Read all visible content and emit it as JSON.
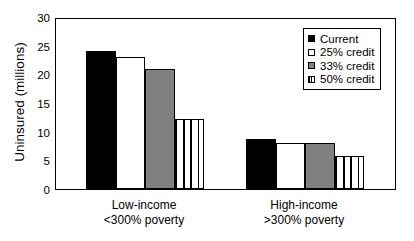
{
  "chart_data": {
    "type": "bar",
    "title": "",
    "subtitle": "",
    "xlabel": "",
    "ylabel": "Uninsured (millions)",
    "ylim": [
      0,
      30
    ],
    "yticks": [
      0,
      5,
      10,
      15,
      20,
      25,
      30
    ],
    "ytick_labels": [
      "0",
      "5",
      "10",
      "15",
      "20",
      "25",
      "30"
    ],
    "grid": false,
    "legend_position": "top-right",
    "categories": [
      "Low-income <300% poverty",
      "High-income >300% poverty"
    ],
    "category_lines": [
      {
        "line1": "Low-income",
        "line2": "<300% poverty"
      },
      {
        "line1": "High-income",
        "line2": ">300% poverty"
      }
    ],
    "series": [
      {
        "name": "Current",
        "values": [
          24.0,
          8.7
        ],
        "fill": "solid-black",
        "color": "#000000"
      },
      {
        "name": "25% credit",
        "values": [
          23.0,
          8.1
        ],
        "fill": "white",
        "color": "#ffffff"
      },
      {
        "name": "33% credit",
        "values": [
          21.0,
          8.0
        ],
        "fill": "gray",
        "color": "#808080"
      },
      {
        "name": "50% credit",
        "values": [
          12.2,
          5.8
        ],
        "fill": "vstripe",
        "color": "#ffffff"
      }
    ]
  },
  "legend": {
    "items": [
      {
        "label": "Current",
        "fill": "solid-black"
      },
      {
        "label": "25% credit",
        "fill": "white"
      },
      {
        "label": "33% credit",
        "fill": "gray"
      },
      {
        "label": "50% credit",
        "fill": "vstripe"
      }
    ]
  },
  "colors": {
    "axis": "#000000",
    "background": "#ffffff",
    "series_black": "#000000",
    "series_white": "#ffffff",
    "series_gray": "#808080"
  }
}
